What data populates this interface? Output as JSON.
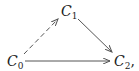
{
  "diagram": {
    "type": "commutative-diagram",
    "nodes": [
      {
        "id": "C0",
        "letter": "C",
        "sub": "0",
        "suffix": ""
      },
      {
        "id": "C1",
        "letter": "C",
        "sub": "1",
        "suffix": ""
      },
      {
        "id": "C2",
        "letter": "C",
        "sub": "2",
        "suffix": ","
      }
    ],
    "edges": [
      {
        "from": "C0",
        "to": "C1",
        "style": "dashed"
      },
      {
        "from": "C1",
        "to": "C2",
        "style": "solid"
      },
      {
        "from": "C0",
        "to": "C2",
        "style": "solid"
      }
    ],
    "colors": {
      "line": "#555555",
      "text": "#222222"
    }
  }
}
